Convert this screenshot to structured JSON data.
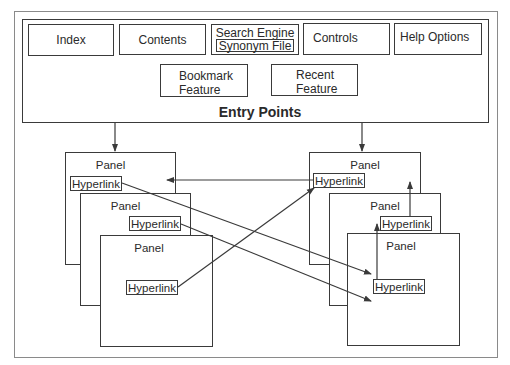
{
  "entry_points": {
    "title": "Entry Points",
    "features": {
      "index": "Index",
      "contents": "Contents",
      "search_engine": "Search Engine",
      "synonym_file": "Synonym File",
      "controls": "Controls",
      "help_options": "Help Options",
      "bookmark_line1": "Bookmark",
      "bookmark_line2": "Feature",
      "recent_line1": "Recent",
      "recent_line2": "Feature"
    }
  },
  "left_stack": {
    "panels": [
      {
        "title": "Panel",
        "hyperlink": "Hyperlink"
      },
      {
        "title": "Panel",
        "hyperlink": "Hyperlink"
      },
      {
        "title": "Panel",
        "hyperlink": "Hyperlink"
      }
    ]
  },
  "right_stack": {
    "panels": [
      {
        "title": "Panel",
        "hyperlink": "Hyperlink"
      },
      {
        "title": "Panel",
        "hyperlink": "Hyperlink"
      },
      {
        "title": "Panel",
        "hyperlink": "Hyperlink"
      }
    ]
  },
  "colors": {
    "line": "#3a3a3a",
    "outer_border": "#8a8a8a",
    "background": "#ffffff"
  }
}
